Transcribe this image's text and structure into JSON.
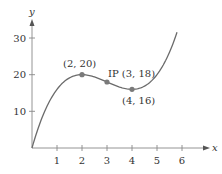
{
  "chart_data": {
    "type": "line",
    "title": "",
    "xlabel": "x",
    "ylabel": "y",
    "xlim": [
      0,
      7
    ],
    "ylim": [
      0,
      35
    ],
    "x_ticks": [
      "1",
      "2",
      "3",
      "4",
      "5",
      "6"
    ],
    "y_ticks": [
      "10",
      "20",
      "30"
    ],
    "grid": false,
    "legend": "none",
    "series": [
      {
        "name": "f(x) = x^3 - 9x^2 + 24x",
        "x": [
          0,
          0.5,
          1,
          1.5,
          2,
          2.5,
          3,
          3.5,
          4,
          4.5,
          5,
          5.5,
          5.8
        ],
        "y": [
          0,
          10.1,
          16,
          18.9,
          20,
          19.6,
          18,
          16.4,
          16,
          17.1,
          20,
          24.9,
          31.5
        ],
        "color": "#6b6b6b"
      }
    ],
    "points": [
      {
        "x": 2,
        "y": 20,
        "label": "(2, 20)"
      },
      {
        "x": 3,
        "y": 18,
        "label": "IP (3, 18)"
      },
      {
        "x": 4,
        "y": 16,
        "label": "(4, 16)"
      }
    ],
    "colors": {
      "curve": "#6b6b6b",
      "points": "#7a7a7a",
      "axes": "#777777",
      "text": "#333333"
    }
  },
  "labels": {
    "x_axis": "x",
    "y_axis": "y",
    "point_max": "(2, 20)",
    "point_ip": "IP (3, 18)",
    "point_min": "(4, 16)",
    "xt1": "1",
    "xt2": "2",
    "xt3": "3",
    "xt4": "4",
    "xt5": "5",
    "xt6": "6",
    "yt10": "10",
    "yt20": "20",
    "yt30": "30"
  }
}
